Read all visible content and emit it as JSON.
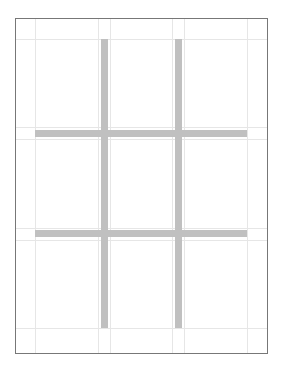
{
  "diagram": {
    "type": "page-layout-grid",
    "canvas": {
      "width": 281,
      "height": 367,
      "background": "#ffffff"
    },
    "page_frame": {
      "x": 15,
      "y": 18,
      "width": 253,
      "height": 336,
      "border_color": "#777777",
      "border_width": 1
    },
    "margin_guides": {
      "color": "#e6e6e6",
      "vertical_x": [
        35,
        98,
        110,
        172,
        184,
        247
      ],
      "horizontal_y": [
        39,
        127,
        139,
        228,
        240,
        328
      ]
    },
    "gutter_bars": {
      "color": "#c0c0c0",
      "vertical": [
        {
          "name": "gutter-col-1",
          "x": 101,
          "y": 39,
          "width": 7,
          "height": 289
        },
        {
          "name": "gutter-col-2",
          "x": 175,
          "y": 39,
          "width": 7,
          "height": 289
        }
      ],
      "horizontal": [
        {
          "name": "gutter-row-1",
          "x": 35,
          "y": 130,
          "width": 212,
          "height": 7
        },
        {
          "name": "gutter-row-2",
          "x": 35,
          "y": 230,
          "width": 212,
          "height": 7
        }
      ]
    },
    "grid": {
      "columns": 3,
      "rows": 3
    }
  }
}
